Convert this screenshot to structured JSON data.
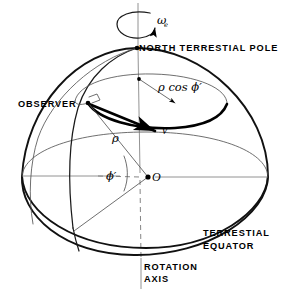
{
  "figure": {
    "background_color": "#ffffff",
    "ink_color": "#000000"
  },
  "labels": {
    "north_pole": "NORTH TERRESTIAL POLE",
    "observer": "OBSERVER",
    "rho_cos_phi": "ρ cos ϕ′",
    "velocity": "v",
    "rho": "ρ",
    "phi_prime": "ϕ′",
    "origin": "O",
    "omega": "ω",
    "omega_subscript": "e",
    "equator_line1": "TERRESTIAL",
    "equator_line2": "EQUATOR",
    "axis_line1": "ROTATION",
    "axis_line2": "AXIS"
  },
  "geometry": {
    "sphere_center": [
      148,
      177
    ],
    "sphere_radius_x": 122,
    "sphere_radius_y": 129,
    "north_pole_point": [
      137,
      48
    ],
    "observer_point": [
      88,
      103
    ],
    "origin_point": [
      148,
      177
    ],
    "latitude_circle_center": [
      150,
      104
    ],
    "latitude_circle_rx": 77,
    "latitude_circle_ry": 26,
    "equator_ellipse_rx": 122,
    "equator_ellipse_ry": 41,
    "right_angle_marker": [
      95,
      98
    ]
  },
  "annotations": {
    "rotation_arrow": "counterclockwise-rotation-about-axis",
    "velocity_arrow": "tangential-velocity-at-observer",
    "rho_cos_phi_arrow": "radius-of-latitude-circle",
    "angle_arc": "geocentric-latitude-angle"
  }
}
